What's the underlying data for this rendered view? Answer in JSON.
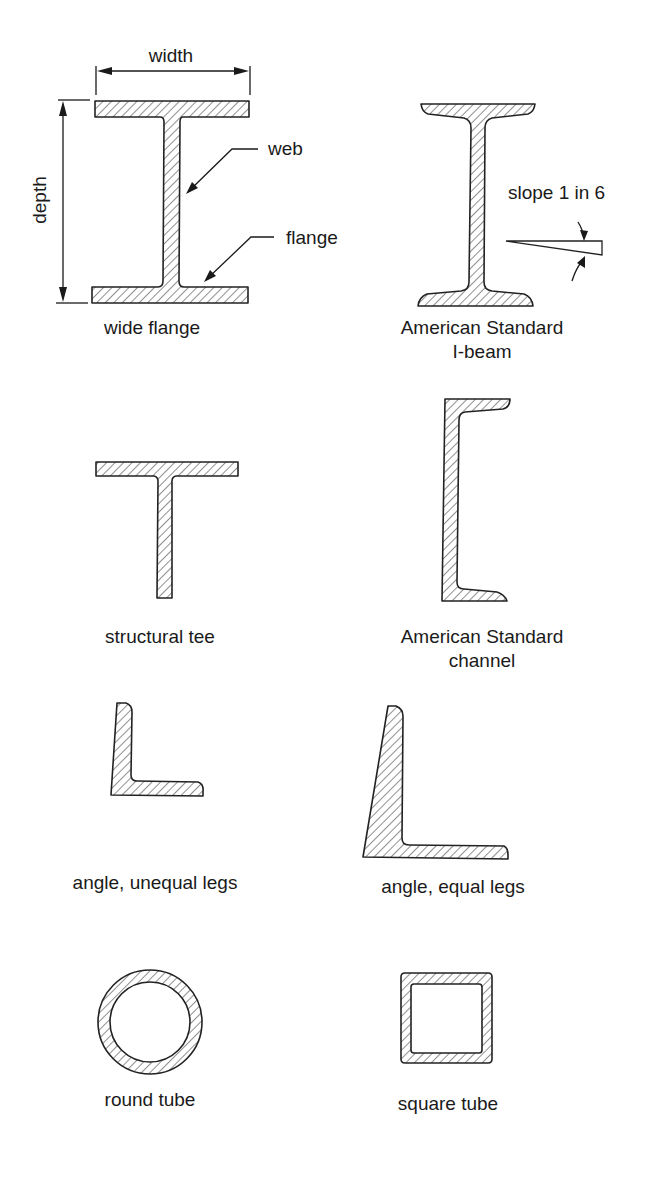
{
  "figure": {
    "shapes": [
      {
        "id": "wide-flange",
        "caption": [
          "wide flange"
        ],
        "annotations": {
          "width": "width",
          "depth": "depth",
          "web": "web",
          "flange": "flange"
        }
      },
      {
        "id": "american-standard-i-beam",
        "caption": [
          "American Standard",
          "I-beam"
        ],
        "annotations": {
          "slope": "slope 1 in 6"
        }
      },
      {
        "id": "structural-tee",
        "caption": [
          "structural tee"
        ]
      },
      {
        "id": "american-standard-channel",
        "caption": [
          "American Standard",
          "channel"
        ]
      },
      {
        "id": "angle-unequal-legs",
        "caption": [
          "angle, unequal legs"
        ]
      },
      {
        "id": "angle-equal-legs",
        "caption": [
          "angle, equal legs"
        ]
      },
      {
        "id": "round-tube",
        "caption": [
          "round tube"
        ]
      },
      {
        "id": "square-tube",
        "caption": [
          "square tube"
        ]
      }
    ],
    "colors": {
      "line": "#222222",
      "hatch": "#333333",
      "background": "#ffffff"
    }
  }
}
